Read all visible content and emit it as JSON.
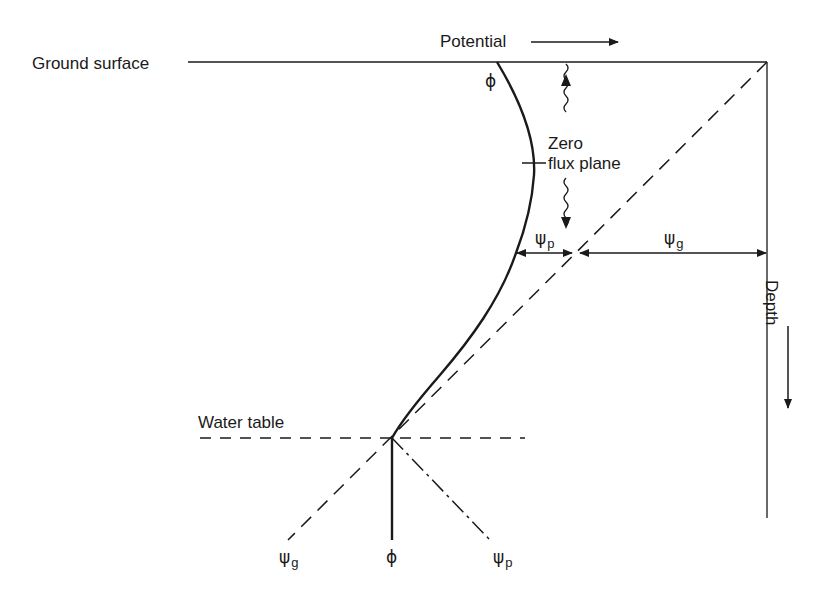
{
  "diagram": {
    "labels": {
      "ground_surface": "Ground surface",
      "potential_axis": "Potential",
      "depth_axis": "Depth",
      "zero_flux_line1": "Zero",
      "zero_flux_line2": "flux plane",
      "water_table": "Water table",
      "phi_top": "ϕ",
      "psi_p_arrow": {
        "symbol": "ψ",
        "sub": "p"
      },
      "psi_g_arrow": {
        "symbol": "ψ",
        "sub": "g"
      },
      "legend_psi_g": {
        "symbol": "ψ",
        "sub": "g"
      },
      "legend_phi": "ϕ",
      "legend_psi_p": {
        "symbol": "ψ",
        "sub": "p"
      }
    },
    "curves": [
      {
        "name": "phi",
        "description": "total potential ϕ (solid curve)",
        "style": "solid"
      },
      {
        "name": "psi_g",
        "description": "gravitational potential ψg (dashed diagonal)",
        "style": "dashed"
      },
      {
        "name": "psi_p",
        "description": "pressure potential ψp (dash-dot below water table)",
        "style": "dash-dot"
      }
    ],
    "colors": {
      "ink": "#1a1a1a",
      "background": "#ffffff"
    }
  }
}
